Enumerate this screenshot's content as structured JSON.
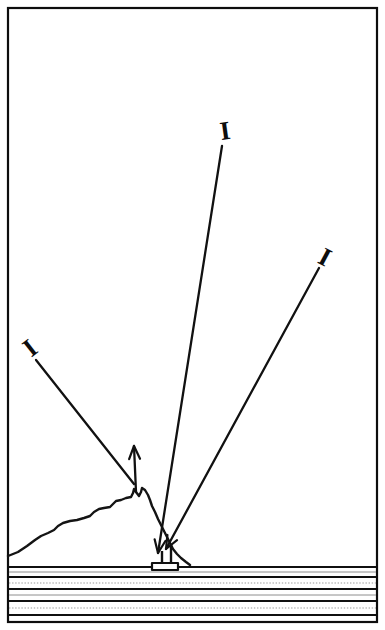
{
  "figure": {
    "background_color": "#ffffff",
    "ink_color": "#111111",
    "width": 385,
    "height": 630,
    "frame": {
      "x": 8,
      "y": 8,
      "width": 369,
      "height": 614,
      "stroke_color": "#0d0d0d"
    }
  },
  "markers": [
    {
      "id": "marker-left",
      "glyph": "I",
      "label": "I",
      "x": 30,
      "y": 348,
      "rotation": -38
    },
    {
      "id": "marker-center",
      "glyph": "I",
      "label": "I",
      "x": 225,
      "y": 131,
      "rotation": -8
    },
    {
      "id": "marker-right",
      "glyph": "I",
      "label": "I",
      "x": 325,
      "y": 257,
      "rotation": 28
    }
  ],
  "rays": [
    {
      "id": "ray-incident-left",
      "description": "incident ray from upper left toward mountain flank",
      "from_x": 36,
      "from_y": 360,
      "to_x": 134,
      "to_y": 484,
      "arrow": "none"
    },
    {
      "id": "ray-reflected-up",
      "description": "reflected ray leaving mountain flank upward",
      "from_x": 136,
      "from_y": 492,
      "to_x": 134,
      "to_y": 446,
      "arrow": "end-up"
    },
    {
      "id": "ray-center-down",
      "description": "ray from upper center down to receiver station",
      "from_x": 222,
      "from_y": 146,
      "to_x": 158,
      "to_y": 553,
      "arrow": "end-down"
    },
    {
      "id": "ray-right-down",
      "description": "ray from upper right down to receiver station",
      "from_x": 319,
      "from_y": 268,
      "to_x": 166,
      "to_y": 549,
      "arrow": "end-down"
    }
  ],
  "terrain": {
    "id": "mountain-ridge",
    "description": "jagged mountain ridge cross-section rising left to a peak then dropping to shoreline",
    "points": "8,556 18,552 27,546 35,540 41,536 48,533 54,530 58,526 63,523 70,521 77,520 84,518 90,516 94,512 99,509 104,508 110,507 113,504 116,501 121,500 126,498 131,497 133,493 134,489 136,492 139,496 141,492 142,488 145,490 148,495 150,500 152,506 155,512 158,519 161,525 164,531 167,537 170,543 173,549 177,554 181,558 186,562 190,565"
  },
  "station": {
    "id": "receiver-station",
    "description": "small receiver platform with vertical mast at shoreline",
    "base_x": 152,
    "base_y": 563,
    "base_width": 26,
    "base_height": 7,
    "mast_x": 171,
    "mast_top_y": 545,
    "mast_bottom_y": 564,
    "post_x": 162,
    "post_top_y": 551,
    "post_bottom_y": 563
  },
  "water": {
    "id": "water-band",
    "description": "layered horizontal lines representing the sea surface and strata",
    "left_x": 9,
    "right_x": 376,
    "lines": [
      {
        "y": 567,
        "style": "solid"
      },
      {
        "y": 572,
        "style": "faint"
      },
      {
        "y": 577,
        "style": "solid"
      },
      {
        "y": 583,
        "style": "dotted"
      },
      {
        "y": 589,
        "style": "solid"
      },
      {
        "y": 595,
        "style": "faint"
      },
      {
        "y": 601,
        "style": "solid"
      },
      {
        "y": 608,
        "style": "dotted"
      },
      {
        "y": 615,
        "style": "solid"
      }
    ]
  }
}
